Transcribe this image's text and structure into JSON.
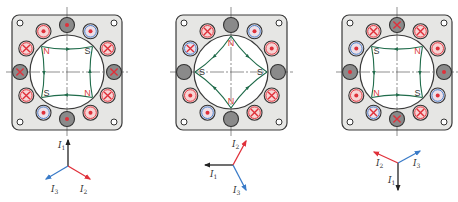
{
  "colors": {
    "frame_fill": "#e6e6e4",
    "frame_stroke": "#3a3a3a",
    "bore_fill": "#ffffff",
    "bore_stroke": "#3a3a3a",
    "centerline": "#444444",
    "field_line": "#1f6b4a",
    "red": "#e0303a",
    "blue": "#3a7bc8",
    "dark": "#8a8a8a",
    "pink_fill": "#f6d4d4",
    "pole_N": "#d94040",
    "pole_S": "#333333",
    "phasor_I1": "#222222",
    "phasor_I2": "#e0303a",
    "phasor_I3": "#3a7bc8"
  },
  "panels": [
    {
      "id": "panel-1",
      "frame": {
        "x": 12,
        "y": 15,
        "w": 110,
        "h": 115
      },
      "center": [
        67,
        72
      ],
      "bore_r": 37,
      "slot_ring_r": 47,
      "slots": [
        {
          "angle": 0,
          "ring": "dark",
          "mark": "dot"
        },
        {
          "angle": 30,
          "ring": "blue",
          "mark": "dot"
        },
        {
          "angle": 60,
          "ring": "red",
          "mark": "cross"
        },
        {
          "angle": 90,
          "ring": "dark",
          "mark": "cross"
        },
        {
          "angle": 120,
          "ring": "red",
          "mark": "cross"
        },
        {
          "angle": 150,
          "ring": "red",
          "mark": "dot"
        },
        {
          "angle": 180,
          "ring": "dark",
          "mark": "dot"
        },
        {
          "angle": 210,
          "ring": "blue",
          "mark": "dot"
        },
        {
          "angle": 240,
          "ring": "red",
          "mark": "cross"
        },
        {
          "angle": 270,
          "ring": "dark",
          "mark": "cross"
        },
        {
          "angle": 300,
          "ring": "red",
          "mark": "cross"
        },
        {
          "angle": 330,
          "ring": "red",
          "mark": "dot"
        }
      ],
      "poles": [
        {
          "label": "N",
          "angle": 315,
          "type": "N"
        },
        {
          "label": "S",
          "angle": 45,
          "type": "S"
        },
        {
          "label": "N",
          "angle": 135,
          "type": "N"
        },
        {
          "label": "S",
          "angle": 225,
          "type": "S"
        }
      ],
      "phasor": {
        "origin": [
          68,
          166
        ],
        "vectors": [
          {
            "name": "I1",
            "label": "I",
            "sub": "1",
            "to": [
              68,
              140
            ],
            "color": "phasor_I1",
            "label_pos": [
              58,
              148
            ]
          },
          {
            "name": "I2",
            "label": "I",
            "sub": "2",
            "to": [
              90,
              179
            ],
            "color": "phasor_I2",
            "label_pos": [
              80,
              192
            ]
          },
          {
            "name": "I3",
            "label": "I",
            "sub": "3",
            "to": [
              46,
              179
            ],
            "color": "phasor_I3",
            "label_pos": [
              51,
              192
            ]
          }
        ]
      }
    },
    {
      "id": "panel-2",
      "frame": {
        "x": 176,
        "y": 15,
        "w": 111,
        "h": 115
      },
      "center": [
        231,
        72
      ],
      "bore_r": 37,
      "slot_ring_r": 47,
      "slots": [
        {
          "angle": 0,
          "ring": "dark",
          "mark": "none"
        },
        {
          "angle": 30,
          "ring": "blue",
          "mark": "dot"
        },
        {
          "angle": 60,
          "ring": "red",
          "mark": "dot"
        },
        {
          "angle": 90,
          "ring": "dark",
          "mark": "none"
        },
        {
          "angle": 120,
          "ring": "red",
          "mark": "cross"
        },
        {
          "angle": 150,
          "ring": "red",
          "mark": "cross"
        },
        {
          "angle": 180,
          "ring": "dark",
          "mark": "none"
        },
        {
          "angle": 210,
          "ring": "blue",
          "mark": "dot"
        },
        {
          "angle": 240,
          "ring": "red",
          "mark": "dot"
        },
        {
          "angle": 270,
          "ring": "dark",
          "mark": "none"
        },
        {
          "angle": 300,
          "ring": "blue",
          "mark": "cross"
        },
        {
          "angle": 330,
          "ring": "red",
          "mark": "cross"
        }
      ],
      "poles": [
        {
          "label": "N",
          "angle": 0,
          "type": "N"
        },
        {
          "label": "S",
          "angle": 90,
          "type": "S"
        },
        {
          "label": "N",
          "angle": 180,
          "type": "N"
        },
        {
          "label": "S",
          "angle": 270,
          "type": "S"
        }
      ],
      "phasor": {
        "origin": [
          233,
          165
        ],
        "vectors": [
          {
            "name": "I1",
            "label": "I",
            "sub": "1",
            "to": [
              205,
              165
            ],
            "color": "phasor_I1",
            "label_pos": [
              210,
              177
            ]
          },
          {
            "name": "I2",
            "label": "I",
            "sub": "2",
            "to": [
              246,
              141
            ],
            "color": "phasor_I2",
            "label_pos": [
              232,
              147
            ]
          },
          {
            "name": "I3",
            "label": "I",
            "sub": "3",
            "to": [
              246,
              190
            ],
            "color": "phasor_I3",
            "label_pos": [
              233,
              193
            ]
          }
        ]
      }
    },
    {
      "id": "panel-3",
      "frame": {
        "x": 342,
        "y": 15,
        "w": 110,
        "h": 115
      },
      "center": [
        397,
        72
      ],
      "bore_r": 37,
      "slot_ring_r": 47,
      "slots": [
        {
          "angle": 0,
          "ring": "dark",
          "mark": "cross"
        },
        {
          "angle": 30,
          "ring": "red",
          "mark": "cross"
        },
        {
          "angle": 60,
          "ring": "red",
          "mark": "dot"
        },
        {
          "angle": 90,
          "ring": "dark",
          "mark": "dot"
        },
        {
          "angle": 120,
          "ring": "blue",
          "mark": "dot"
        },
        {
          "angle": 150,
          "ring": "red",
          "mark": "cross"
        },
        {
          "angle": 180,
          "ring": "dark",
          "mark": "cross"
        },
        {
          "angle": 210,
          "ring": "blue",
          "mark": "cross"
        },
        {
          "angle": 240,
          "ring": "red",
          "mark": "dot"
        },
        {
          "angle": 270,
          "ring": "dark",
          "mark": "dot"
        },
        {
          "angle": 300,
          "ring": "blue",
          "mark": "dot"
        },
        {
          "angle": 330,
          "ring": "red",
          "mark": "cross"
        }
      ],
      "poles": [
        {
          "label": "S",
          "angle": 315,
          "type": "S"
        },
        {
          "label": "N",
          "angle": 45,
          "type": "N"
        },
        {
          "label": "S",
          "angle": 135,
          "type": "S"
        },
        {
          "label": "N",
          "angle": 225,
          "type": "S"
        }
      ],
      "phasor": {
        "origin": [
          398,
          163
        ],
        "vectors": [
          {
            "name": "I1",
            "label": "I",
            "sub": "1",
            "to": [
              398,
              190
            ],
            "color": "phasor_I1",
            "label_pos": [
              388,
              183
            ]
          },
          {
            "name": "I2",
            "label": "I",
            "sub": "2",
            "to": [
              374,
              152
            ],
            "color": "phasor_I2",
            "label_pos": [
              376,
              166
            ]
          },
          {
            "name": "I3",
            "label": "I",
            "sub": "3",
            "to": [
              420,
              151
            ],
            "color": "phasor_I3",
            "label_pos": [
              413,
              166
            ]
          }
        ]
      }
    }
  ]
}
